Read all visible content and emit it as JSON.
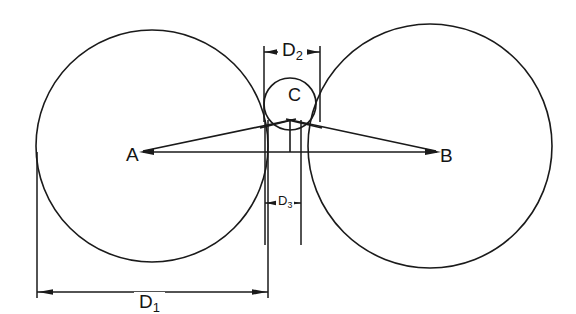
{
  "diagram": {
    "background_color": "#ffffff",
    "line_color": "#1a1a1a",
    "points": [
      {
        "id": "A",
        "label": "A",
        "role": "center-of-left-circle",
        "x": 140,
        "y": 152
      },
      {
        "id": "B",
        "label": "B",
        "role": "center-of-right-circle",
        "x": 438,
        "y": 152
      },
      {
        "id": "C",
        "label": "C",
        "role": "center-of-small-circle",
        "x": 290,
        "y": 103
      }
    ],
    "circles": [
      {
        "id": "left-circle",
        "center_x": 152,
        "center_y": 146,
        "radius": 116
      },
      {
        "id": "right-circle",
        "center_x": 430,
        "center_y": 146,
        "radius": 122
      },
      {
        "id": "small-circle",
        "center_x": 290,
        "center_y": 104,
        "radius": 26
      }
    ],
    "dimensions": [
      {
        "id": "D1",
        "label": "D",
        "subscript": "1",
        "orientation": "horizontal",
        "from_x": 37,
        "to_x": 268,
        "line_y": 292,
        "arrow_direction": "outward"
      },
      {
        "id": "D2",
        "label": "D",
        "subscript": "2",
        "orientation": "horizontal",
        "from_x": 264,
        "to_x": 320,
        "line_y": 52,
        "arrow_direction": "inward"
      },
      {
        "id": "D3",
        "label": "D",
        "subscript": "3",
        "orientation": "horizontal",
        "from_x": 265,
        "to_x": 301,
        "line_y": 203,
        "arrow_direction": "inward"
      }
    ],
    "rays": [
      {
        "id": "ray-A-to-C-top",
        "from": "A",
        "to": "small-circle-top-left"
      },
      {
        "id": "ray-B-to-C-top",
        "from": "B",
        "to": "small-circle-top-right"
      },
      {
        "id": "baseline-A-B",
        "from": "A",
        "to": "B"
      }
    ]
  }
}
